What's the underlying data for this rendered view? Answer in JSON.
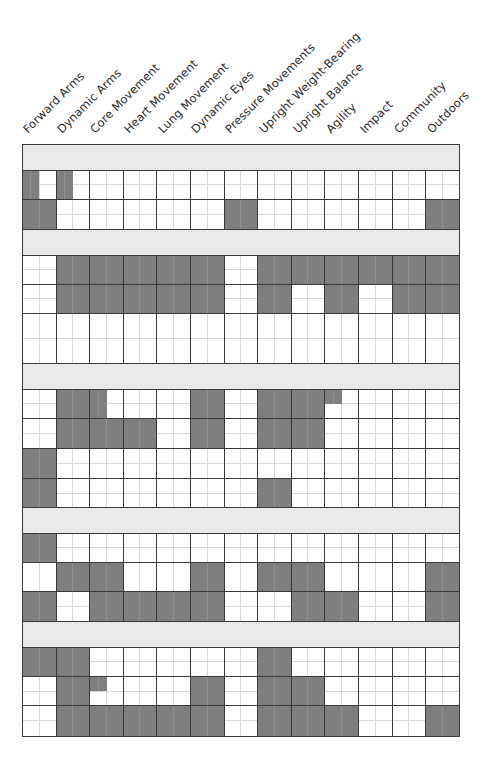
{
  "columns": [
    {
      "label": "Forward Arms"
    },
    {
      "label": "Dynamic Arms"
    },
    {
      "label": "Core Movement"
    },
    {
      "label": "Heart Movement"
    },
    {
      "label": "Lung Movement"
    },
    {
      "label": "Dynamic Eyes"
    },
    {
      "label": "Pressure Movements"
    },
    {
      "label": "Upright Weight-Bearing"
    },
    {
      "label": "Upright Balance"
    },
    {
      "label": "Agility"
    },
    {
      "label": "Impact"
    },
    {
      "label": "Community"
    },
    {
      "label": "Outdoors"
    }
  ],
  "colors": {
    "filled": "#7f7f7f",
    "band": "#e9e9e9",
    "border": "#3a3a3a",
    "subgrid": "#d8d8d8"
  },
  "sections": [
    {
      "rows": [
        {
          "height": 29,
          "cells": [
            "left",
            "left",
            "",
            "",
            "",
            "",
            "",
            "",
            "",
            "",
            "",
            "",
            ""
          ]
        },
        {
          "height": 30,
          "cells": [
            "full",
            "",
            "",
            "",
            "",
            "",
            "full",
            "",
            "",
            "",
            "",
            "",
            "full"
          ]
        }
      ]
    },
    {
      "rows": [
        {
          "height": 29,
          "cells": [
            "",
            "full",
            "full",
            "full",
            "full",
            "full",
            "",
            "full",
            "full",
            "full",
            "full",
            "full",
            "full"
          ]
        },
        {
          "height": 29,
          "cells": [
            "",
            "full",
            "full",
            "full",
            "full",
            "full",
            "",
            "full",
            "",
            "full",
            "",
            "full",
            "full"
          ]
        },
        {
          "height": 50,
          "cells": [
            "",
            "",
            "",
            "",
            "",
            "",
            "",
            "",
            "",
            "",
            "",
            "",
            ""
          ]
        }
      ]
    },
    {
      "rows": [
        {
          "height": 29,
          "cells": [
            "",
            "full",
            "left",
            "",
            "",
            "full",
            "",
            "full",
            "full",
            "tl",
            "",
            "",
            ""
          ]
        },
        {
          "height": 30,
          "cells": [
            "",
            "full",
            "full",
            "full",
            "",
            "full",
            "",
            "full",
            "full",
            "",
            "",
            "",
            ""
          ]
        },
        {
          "height": 30,
          "cells": [
            "full",
            "",
            "",
            "",
            "",
            "",
            "",
            "",
            "",
            "",
            "",
            "",
            ""
          ]
        },
        {
          "height": 29,
          "cells": [
            "full",
            "",
            "",
            "",
            "",
            "",
            "",
            "full",
            "",
            "",
            "",
            "",
            ""
          ]
        }
      ]
    },
    {
      "rows": [
        {
          "height": 29,
          "cells": [
            "full",
            "",
            "",
            "",
            "",
            "",
            "",
            "",
            "",
            "",
            "",
            "",
            ""
          ]
        },
        {
          "height": 29,
          "cells": [
            "",
            "full",
            "full",
            "",
            "",
            "full",
            "",
            "full",
            "full",
            "",
            "",
            "",
            "full"
          ]
        },
        {
          "height": 30,
          "cells": [
            "full",
            "",
            "full",
            "full",
            "full",
            "full",
            "",
            "",
            "full",
            "full",
            "",
            "",
            "full"
          ]
        }
      ]
    },
    {
      "rows": [
        {
          "height": 29,
          "cells": [
            "full",
            "full",
            "",
            "",
            "",
            "",
            "",
            "full",
            "",
            "",
            "",
            "",
            ""
          ]
        },
        {
          "height": 29,
          "cells": [
            "",
            "full",
            "tl",
            "",
            "",
            "full",
            "",
            "full",
            "full",
            "",
            "",
            "",
            ""
          ]
        },
        {
          "height": 30,
          "cells": [
            "",
            "full",
            "full",
            "full",
            "full",
            "full",
            "",
            "full",
            "full",
            "full",
            "",
            "",
            "full"
          ]
        }
      ]
    }
  ]
}
